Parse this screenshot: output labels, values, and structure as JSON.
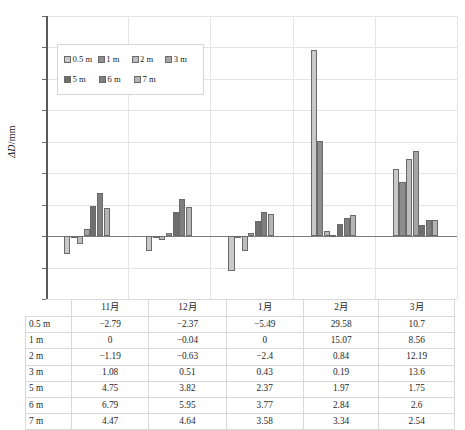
{
  "chart_data": {
    "type": "bar",
    "title": "",
    "subtitle": "",
    "xlabel": "",
    "ylabel": "ΔD/mm",
    "ylim": [
      -10,
      35
    ],
    "yticks": [
      -10,
      -5,
      0,
      5,
      10,
      15,
      20,
      25,
      30,
      35
    ],
    "ytick_labels": [
      "−10",
      "−5",
      "0",
      "5",
      "10",
      "15",
      "20",
      "25",
      "30",
      "35"
    ],
    "grid": true,
    "legend_position": "upper-left-inside",
    "categories": [
      "11月",
      "12月",
      "1月",
      "2月",
      "3月"
    ],
    "series": [
      {
        "name": "0.5 m",
        "color": "#c9c9c9",
        "values": [
          -2.79,
          -2.37,
          -5.49,
          29.58,
          10.7
        ]
      },
      {
        "name": "1 m",
        "color": "#8e8e8e",
        "values": [
          0,
          -0.04,
          0,
          15.07,
          8.56
        ]
      },
      {
        "name": "2 m",
        "color": "#bdbdbd",
        "values": [
          -1.19,
          -0.63,
          -2.4,
          0.84,
          12.19
        ]
      },
      {
        "name": "3 m",
        "color": "#a5a5a5",
        "values": [
          1.08,
          0.51,
          0.43,
          0.19,
          13.6
        ]
      },
      {
        "name": "5 m",
        "color": "#6f6f6f",
        "values": [
          4.75,
          3.82,
          2.37,
          1.97,
          1.75
        ]
      },
      {
        "name": "6 m",
        "color": "#7f7f7f",
        "values": [
          6.79,
          5.95,
          3.77,
          2.84,
          2.6
        ]
      },
      {
        "name": "7 m",
        "color": "#b5b5b5",
        "values": [
          4.47,
          4.64,
          3.58,
          3.34,
          2.54
        ]
      }
    ]
  },
  "legend": {
    "rows": [
      [
        "0.5 m",
        "1 m",
        "2 m",
        "3 m"
      ],
      [
        "5 m",
        "6 m",
        "7 m"
      ]
    ]
  },
  "table": {
    "corner_label": "",
    "columns": [
      "11月",
      "12月",
      "1月",
      "2月",
      "3月"
    ],
    "rows": [
      {
        "label": "0.5 m",
        "cells": [
          "−2.79",
          "−2.37",
          "−5.49",
          "29.58",
          "10.7"
        ]
      },
      {
        "label": "1 m",
        "cells": [
          "0",
          "−0.04",
          "0",
          "15.07",
          "8.56"
        ]
      },
      {
        "label": "2 m",
        "cells": [
          "−1.19",
          "−0.63",
          "−2.4",
          "0.84",
          "12.19"
        ]
      },
      {
        "label": "3 m",
        "cells": [
          "1.08",
          "0.51",
          "0.43",
          "0.19",
          "13.6"
        ]
      },
      {
        "label": "5 m",
        "cells": [
          "4.75",
          "3.82",
          "2.37",
          "1.97",
          "1.75"
        ]
      },
      {
        "label": "6 m",
        "cells": [
          "6.79",
          "5.95",
          "3.77",
          "2.84",
          "2.6"
        ]
      },
      {
        "label": "7 m",
        "cells": [
          "4.47",
          "4.64",
          "3.58",
          "3.34",
          "2.54"
        ]
      }
    ]
  },
  "axis": {
    "y_title_delta": "ΔD",
    "y_title_unit": "/mm"
  }
}
